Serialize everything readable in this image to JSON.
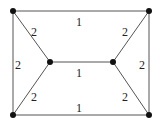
{
  "graph": {
    "nodes": [
      {
        "id": "tl",
        "x": 13,
        "y": 11
      },
      {
        "id": "tr",
        "x": 149,
        "y": 11
      },
      {
        "id": "ml",
        "x": 50,
        "y": 62
      },
      {
        "id": "mr",
        "x": 113,
        "y": 62
      },
      {
        "id": "bl",
        "x": 13,
        "y": 115
      },
      {
        "id": "br",
        "x": 149,
        "y": 115
      }
    ],
    "edges": [
      {
        "from": "tl",
        "to": "tr",
        "weight": "1"
      },
      {
        "from": "tl",
        "to": "bl",
        "weight": "2"
      },
      {
        "from": "tl",
        "to": "ml",
        "weight": "2"
      },
      {
        "from": "tr",
        "to": "mr",
        "weight": "2"
      },
      {
        "from": "tr",
        "to": "br",
        "weight": "2"
      },
      {
        "from": "ml",
        "to": "mr",
        "weight": "1"
      },
      {
        "from": "ml",
        "to": "bl",
        "weight": "2"
      },
      {
        "from": "mr",
        "to": "br",
        "weight": "2"
      },
      {
        "from": "bl",
        "to": "br",
        "weight": "1"
      }
    ]
  }
}
